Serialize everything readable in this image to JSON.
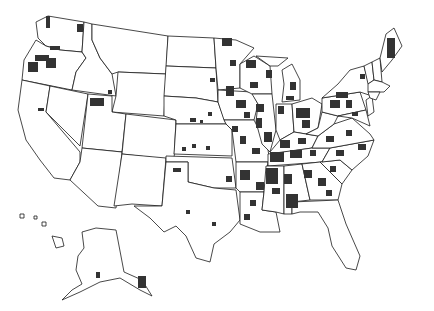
{
  "map": {
    "type": "choropleth",
    "region": "United States (counties)",
    "colors": {
      "background": "#ffffff",
      "state_fill": "#ffffff",
      "border": "#1a1a1a",
      "highlighted_county": "#333333"
    },
    "legend": null,
    "insets": [
      "Alaska",
      "Hawaii"
    ],
    "highlighted_regions_description": "Dark-shaded counties concentrated in the Southeast, Midwest, Great Lakes, Mid-Atlantic and northern Maine; sparse in the Great Plains and West (small clusters in Washington, Oregon, northern Idaho, Utah, Texas, Oklahoma, Kansas, Nebraska, Dakotas, southeast Alaska)"
  }
}
